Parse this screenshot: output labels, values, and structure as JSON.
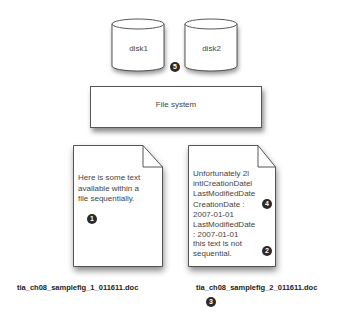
{
  "disks": [
    {
      "label": "disk1"
    },
    {
      "label": "disk2"
    }
  ],
  "file_system": {
    "label": "File system"
  },
  "documents": [
    {
      "lines": [
        "Here is some text",
        "available within a",
        "file sequentially."
      ],
      "filename": "tia_ch08_samplefig_1_011611.doc"
    },
    {
      "lines": [
        "Unfortunately 2l",
        "intlCreationDatel",
        "LastModifiedDate",
        "CreationDate :",
        "2007-01-01",
        "LastModifiedDate",
        ": 2007-01-01"
      ],
      "trailing_lines": [
        "this text is not",
        "sequential."
      ],
      "filename": "tia_ch08_samplefig_2_011611.doc"
    }
  ],
  "callouts": {
    "c1": "1",
    "c2": "2",
    "c3": "3",
    "c4": "4",
    "c5": "5"
  }
}
